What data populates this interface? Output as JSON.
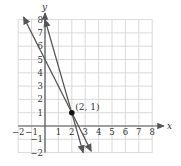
{
  "chart_data": {
    "type": "line",
    "title": "",
    "xlabel": "x",
    "ylabel": "y",
    "xlim": [
      -2,
      8
    ],
    "ylim": [
      -2,
      8
    ],
    "grid": true,
    "x_ticks": [
      "−2",
      "−1",
      "1",
      "2",
      "3",
      "4",
      "5",
      "6",
      "7",
      "8"
    ],
    "x_tick_values": [
      -2,
      -1,
      1,
      2,
      3,
      4,
      5,
      6,
      7,
      8
    ],
    "y_ticks": [
      "−2",
      "−1",
      "1",
      "2",
      "3",
      "4",
      "5",
      "6",
      "7",
      "8"
    ],
    "y_tick_values": [
      -2,
      -1,
      1,
      2,
      3,
      4,
      5,
      6,
      7,
      8
    ],
    "series": [
      {
        "name": "line-1",
        "equation": "y = -3.5x + 8",
        "x": [
          0,
          2.85
        ],
        "y": [
          8,
          -2
        ],
        "arrows": "both"
      },
      {
        "name": "line-2",
        "equation": "y = -2x + 5",
        "x": [
          -1.6,
          3.45
        ],
        "y": [
          8.2,
          -1.9
        ],
        "arrows": "both"
      }
    ],
    "points": [
      {
        "x": 2,
        "y": 1,
        "label": "(2, 1)"
      }
    ]
  },
  "colors": {
    "grid": "#d0d0d0",
    "axis": "#555555",
    "line": "#555555",
    "point": "#111111"
  }
}
